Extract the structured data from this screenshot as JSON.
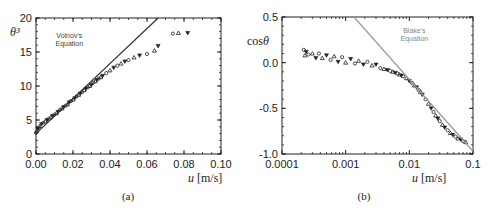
{
  "chart_data": [
    {
      "id": "a",
      "type": "scatter",
      "caption": "(a)",
      "title": "",
      "xlabel": "u [m/s]",
      "ylabel": "θ³",
      "xscale": "linear",
      "xlim": [
        0,
        0.1
      ],
      "ylim": [
        0,
        20
      ],
      "xticks": [
        0,
        0.02,
        0.04,
        0.06,
        0.08,
        0.1
      ],
      "xtick_labels": [
        "0.00",
        "0.02",
        "0.04",
        "0.06",
        "0.08",
        "0.10"
      ],
      "yticks": [
        0,
        5,
        10,
        15,
        20
      ],
      "ytick_labels": [
        "0",
        "5",
        "10",
        "15",
        "20"
      ],
      "grid": false,
      "annotation": {
        "text_line1": "Volnov's",
        "text_line2": "Equation",
        "x": 0.018,
        "y": 17.0,
        "color": "#444444"
      },
      "line": {
        "name": "Volnov's Equation",
        "x": [
          0.0,
          0.066
        ],
        "y": [
          3.0,
          20.0
        ],
        "color": "#333333"
      },
      "series": [
        {
          "name": "Experimental data",
          "marker": "mixed",
          "x": [
            0.0,
            0.0005,
            0.001,
            0.0015,
            0.002,
            0.003,
            0.004,
            0.005,
            0.006,
            0.007,
            0.008,
            0.009,
            0.01,
            0.011,
            0.012,
            0.013,
            0.014,
            0.015,
            0.016,
            0.017,
            0.018,
            0.019,
            0.02,
            0.021,
            0.022,
            0.023,
            0.024,
            0.025,
            0.026,
            0.027,
            0.028,
            0.029,
            0.03,
            0.031,
            0.032,
            0.033,
            0.034,
            0.035,
            0.036,
            0.038,
            0.04,
            0.042,
            0.044,
            0.046,
            0.048,
            0.05,
            0.053,
            0.056,
            0.06,
            0.064,
            0.066,
            0.074,
            0.077,
            0.082
          ],
          "y": [
            3.1,
            3.4,
            3.7,
            3.9,
            4.1,
            4.4,
            4.6,
            4.8,
            5.0,
            5.2,
            5.4,
            5.6,
            5.8,
            6.0,
            6.2,
            6.5,
            6.7,
            6.9,
            7.1,
            7.3,
            7.6,
            7.8,
            8.0,
            8.2,
            8.5,
            8.7,
            8.9,
            9.1,
            9.4,
            9.6,
            9.8,
            10.0,
            10.2,
            10.5,
            10.7,
            10.9,
            11.1,
            11.3,
            11.5,
            11.9,
            12.3,
            12.7,
            13.0,
            13.3,
            13.6,
            13.8,
            14.2,
            14.5,
            14.7,
            15.2,
            15.9,
            17.7,
            17.8,
            17.8
          ]
        }
      ]
    },
    {
      "id": "b",
      "type": "scatter",
      "caption": "(b)",
      "title": "",
      "xlabel": "u [m/s]",
      "ylabel": "cosθ",
      "xscale": "log",
      "xlim": [
        0.0001,
        0.1
      ],
      "ylim": [
        -1.0,
        0.5
      ],
      "xticks": [
        0.0001,
        0.001,
        0.01,
        0.1
      ],
      "xtick_labels": [
        "0.0001",
        "0.001",
        "0.01",
        "0.1"
      ],
      "yticks": [
        -1.0,
        -0.5,
        0.0,
        0.5
      ],
      "ytick_labels": [
        "-1.0",
        "-0.5",
        "0.0",
        "0.5"
      ],
      "grid": false,
      "annotation": {
        "text_line1": "Blake's",
        "text_line2": "Equation",
        "x": 0.012,
        "y": 0.33,
        "color": "#888888"
      },
      "line": {
        "name": "Blake's Equation",
        "x": [
          0.00135,
          0.1
        ],
        "y": [
          0.5,
          -0.97
        ],
        "color": "#999999"
      },
      "series": [
        {
          "name": "Experimental data",
          "marker": "mixed",
          "x": [
            0.00022,
            0.00023,
            0.00024,
            0.00026,
            0.0003,
            0.00034,
            0.00038,
            0.00043,
            0.0005,
            0.00058,
            0.00066,
            0.00076,
            0.00088,
            0.001,
            0.0012,
            0.0014,
            0.0016,
            0.0019,
            0.0022,
            0.0026,
            0.003,
            0.0035,
            0.004,
            0.0045,
            0.005,
            0.0055,
            0.006,
            0.0065,
            0.007,
            0.0075,
            0.008,
            0.009,
            0.01,
            0.011,
            0.012,
            0.013,
            0.014,
            0.015,
            0.016,
            0.018,
            0.02,
            0.022,
            0.024,
            0.026,
            0.028,
            0.03,
            0.033,
            0.036,
            0.04,
            0.044,
            0.048,
            0.053,
            0.058,
            0.064,
            0.07,
            0.077
          ],
          "y": [
            0.14,
            0.08,
            0.12,
            0.09,
            0.1,
            0.05,
            0.1,
            0.05,
            0.08,
            0.03,
            0.07,
            0.01,
            0.06,
            0.0,
            0.04,
            -0.01,
            0.02,
            -0.02,
            0.01,
            -0.03,
            -0.02,
            -0.06,
            -0.07,
            -0.08,
            -0.09,
            -0.1,
            -0.11,
            -0.12,
            -0.13,
            -0.14,
            -0.15,
            -0.17,
            -0.2,
            -0.22,
            -0.25,
            -0.27,
            -0.3,
            -0.32,
            -0.35,
            -0.4,
            -0.45,
            -0.5,
            -0.54,
            -0.58,
            -0.61,
            -0.64,
            -0.68,
            -0.71,
            -0.74,
            -0.77,
            -0.79,
            -0.81,
            -0.83,
            -0.84,
            -0.86,
            -0.87
          ]
        }
      ]
    }
  ]
}
